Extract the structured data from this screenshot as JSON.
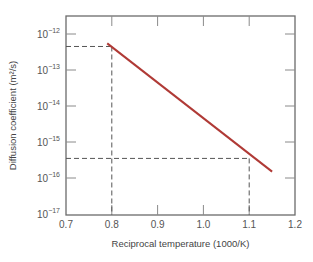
{
  "chart_data": {
    "type": "line",
    "title": "",
    "xlabel": "Reciprocal temperature (1000/K)",
    "ylabel": "Diffusion coefficient (m²/s)",
    "xlim": [
      0.7,
      1.2
    ],
    "ylim": [
      1e-17,
      1e-12
    ],
    "yscale": "log",
    "grid": false,
    "x_ticks": [
      "0.7",
      "0.8",
      "0.9",
      "1.0",
      "1.1",
      "1.2"
    ],
    "y_ticks": [
      {
        "base": "10",
        "exp": "−12"
      },
      {
        "base": "10",
        "exp": "−13"
      },
      {
        "base": "10",
        "exp": "−14"
      },
      {
        "base": "10",
        "exp": "−15"
      },
      {
        "base": "10",
        "exp": "−16"
      },
      {
        "base": "10",
        "exp": "−17"
      }
    ],
    "series": [
      {
        "name": "ln D vs 1/T",
        "color": "#b03a36",
        "x": [
          0.79,
          1.15
        ],
        "y": [
          5.5e-13,
          1.5e-16
        ]
      }
    ],
    "reference_lines": [
      {
        "x": 0.8,
        "y": 4.5e-13,
        "style": "dashed"
      },
      {
        "x": 1.1,
        "y": 3.5e-16,
        "style": "dashed"
      }
    ]
  }
}
